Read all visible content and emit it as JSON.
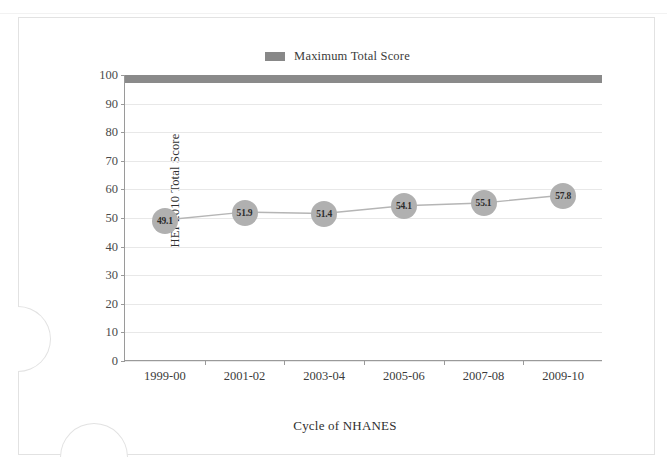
{
  "legend": {
    "label": "Maximum Total Score",
    "swatch_color": "#888888"
  },
  "axis_titles": {
    "y": "HEI-2010 Total Score",
    "x": "Cycle of NHANES"
  },
  "chart_data": {
    "type": "line",
    "title": "",
    "subtitle": "",
    "xlabel": "Cycle of NHANES",
    "ylabel": "HEI-2010 Total Score",
    "categories": [
      "1999-00",
      "2001-02",
      "2003-04",
      "2005-06",
      "2007-08",
      "2009-10"
    ],
    "ylim": [
      0,
      100
    ],
    "yticks": [
      0,
      10,
      20,
      30,
      40,
      50,
      60,
      70,
      80,
      90,
      100
    ],
    "ytick_labels": [
      "0",
      "10",
      "20",
      "30",
      "40",
      "50",
      "60",
      "70",
      "80",
      "90",
      "100"
    ],
    "grid": true,
    "legend_position": "top-center",
    "series": [
      {
        "name": "HEI-2010 Total Score",
        "type": "line",
        "marker": "circle",
        "marker_color": "#b0b0b0",
        "line_color": "#b5b5b5",
        "values": [
          49.1,
          51.9,
          51.4,
          54.1,
          55.1,
          57.8
        ],
        "data_labels": [
          "49.1",
          "51.9",
          "51.4",
          "54.1",
          "55.1",
          "57.8"
        ]
      },
      {
        "name": "Maximum Total Score",
        "type": "reference-band",
        "color": "#8a8a8a",
        "value": 100
      }
    ]
  }
}
